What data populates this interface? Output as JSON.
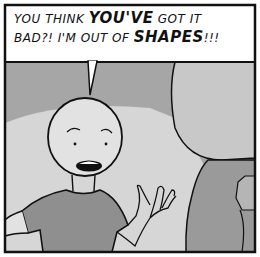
{
  "comic": {
    "caption": {
      "line1_a": "YOU THINK ",
      "line1_em": "YOU'VE",
      "line1_b": " GOT IT",
      "line2_a": "BAD?! I'M OUT OF ",
      "line2_em": "SHAPES",
      "line2_b": "!!!"
    },
    "colors": {
      "background_dark": "#a6a6a6",
      "spotlight": "#d6d6d6",
      "figure_right": "#c4c4c4",
      "shirt": "#8f8f8f",
      "skin": "#e2e2e2",
      "outline": "#111111",
      "caption_bg": "#ffffff"
    }
  }
}
